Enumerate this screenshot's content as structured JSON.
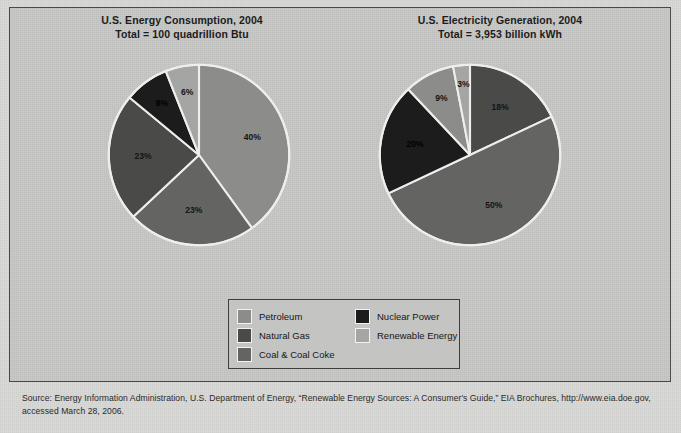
{
  "figure": {
    "background_color": "#c8c8c6",
    "border_color": "#4a4a4a"
  },
  "charts": [
    {
      "id": "us-energy-consumption-2004",
      "title_line1": "U.S. Energy Consumption, 2004",
      "title_line2": "Total = 100 quadrillion Btu"
    },
    {
      "id": "us-electricity-generation-2004",
      "title_line1": "U.S. Electricity Generation, 2004",
      "title_line2": "Total = 3,953 billion kWh"
    }
  ],
  "legend": {
    "items": [
      {
        "label": "Petroleum",
        "color": "#8c8c8a"
      },
      {
        "label": "Nuclear Power",
        "color": "#1c1c1c"
      },
      {
        "label": "Natural Gas",
        "color": "#4a4a48"
      },
      {
        "label": "Renewable Energy",
        "color": "#a5a5a3"
      },
      {
        "label": "Coal & Coal Coke",
        "color": "#646462"
      }
    ]
  },
  "source": {
    "line1": "Source: Energy Information Administration, U.S. Department of Energy, “Renewable Energy Sources: A Consumer's Guide,” EIA Brochures, http://www.eia.doe.gov,",
    "line2": "accessed March 28, 2006."
  },
  "chart_data": [
    {
      "type": "pie",
      "title": "U.S. Energy Consumption, 2004",
      "subtitle": "Total = 100 quadrillion Btu",
      "unit": "quadrillion Btu",
      "total": 100,
      "categories": [
        "Petroleum",
        "Coal & Coal Coke",
        "Natural Gas",
        "Nuclear Power",
        "Renewable Energy"
      ],
      "values": [
        40,
        23,
        23,
        8,
        6
      ],
      "labels": [
        "40%",
        "23%",
        "23%",
        "8%",
        "6%"
      ],
      "colors": [
        "#8c8c8a",
        "#646462",
        "#4a4a48",
        "#1c1c1c",
        "#a5a5a3"
      ],
      "legend_position": "bottom-center",
      "start_angle_deg": 0,
      "direction": "clockwise"
    },
    {
      "type": "pie",
      "title": "U.S. Electricity Generation, 2004",
      "subtitle": "Total = 3,953 billion kWh",
      "unit": "billion kWh",
      "total": 3953,
      "categories": [
        "Natural Gas",
        "Coal & Coal Coke",
        "Nuclear Power",
        "Renewable Energy",
        "Petroleum"
      ],
      "values": [
        18,
        50,
        20,
        9,
        3
      ],
      "labels": [
        "18%",
        "50%",
        "20%",
        "9%",
        "3%"
      ],
      "colors": [
        "#4a4a48",
        "#646462",
        "#1c1c1c",
        "#8c8c8a",
        "#a5a5a3"
      ],
      "legend_position": "bottom-center",
      "start_angle_deg": 0,
      "direction": "clockwise"
    }
  ]
}
